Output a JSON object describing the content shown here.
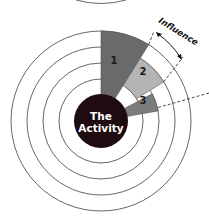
{
  "diagram": {
    "center_label": {
      "line1": "The",
      "line2": "Activity"
    },
    "rings": 4,
    "segments": [
      {
        "label": "1",
        "shade": "dark-gray",
        "color": "#6a6a6a"
      },
      {
        "label": "2",
        "shade": "light-gray",
        "color": "#b4b4b4"
      },
      {
        "label": "3",
        "shade": "medium-gray",
        "color": "#7c7c7c"
      }
    ],
    "annotation": {
      "label": "Influence",
      "arrow": "double-headed curved arrow"
    },
    "colors": {
      "center_disc": "#1f0c10",
      "ring_stroke": "#555555",
      "background": "#ffffff"
    }
  }
}
